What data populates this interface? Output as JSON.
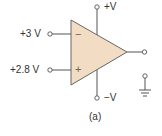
{
  "diagram": {
    "type": "op-amp comparator",
    "inputs": {
      "inverting": {
        "label": "+3 V",
        "sign": "−"
      },
      "non_inverting": {
        "label": "+2.8 V",
        "sign": "+"
      }
    },
    "supply": {
      "positive": "+V",
      "negative": "−V"
    },
    "caption": "(a)",
    "colors": {
      "body": "#f3dcc4",
      "stroke": "#555555"
    }
  }
}
